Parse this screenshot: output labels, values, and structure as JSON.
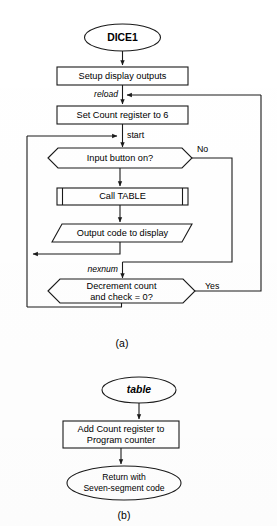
{
  "figure": {
    "caption_a": "(a)",
    "caption_b": "(b)"
  },
  "flowchart_a": {
    "name": "DICE1 main routine",
    "start_terminator": "DICE1",
    "process_setup": "Setup display outputs",
    "label_reload": "reload",
    "process_set_count": "Set Count register to 6",
    "label_start": "start",
    "decision_input": "Input button on?",
    "decision_input_branch_no": "No",
    "subroutine_call": "Call TABLE",
    "io_output": "Output code to display",
    "label_nexnum": "nexnum",
    "decision_decrement_line1": "Decrement count",
    "decision_decrement_line2": "and check = 0?",
    "decision_decrement_branch_yes": "Yes"
  },
  "flowchart_b": {
    "name": "table subroutine",
    "start_terminator": "table",
    "process_add": "Add Count register to",
    "process_add_line2": "Program counter",
    "end_terminator_line1": "Return with",
    "end_terminator_line2": "Seven-segment code"
  },
  "colors": {
    "ink": "#1a1a1a",
    "paper": "#ffffff"
  }
}
